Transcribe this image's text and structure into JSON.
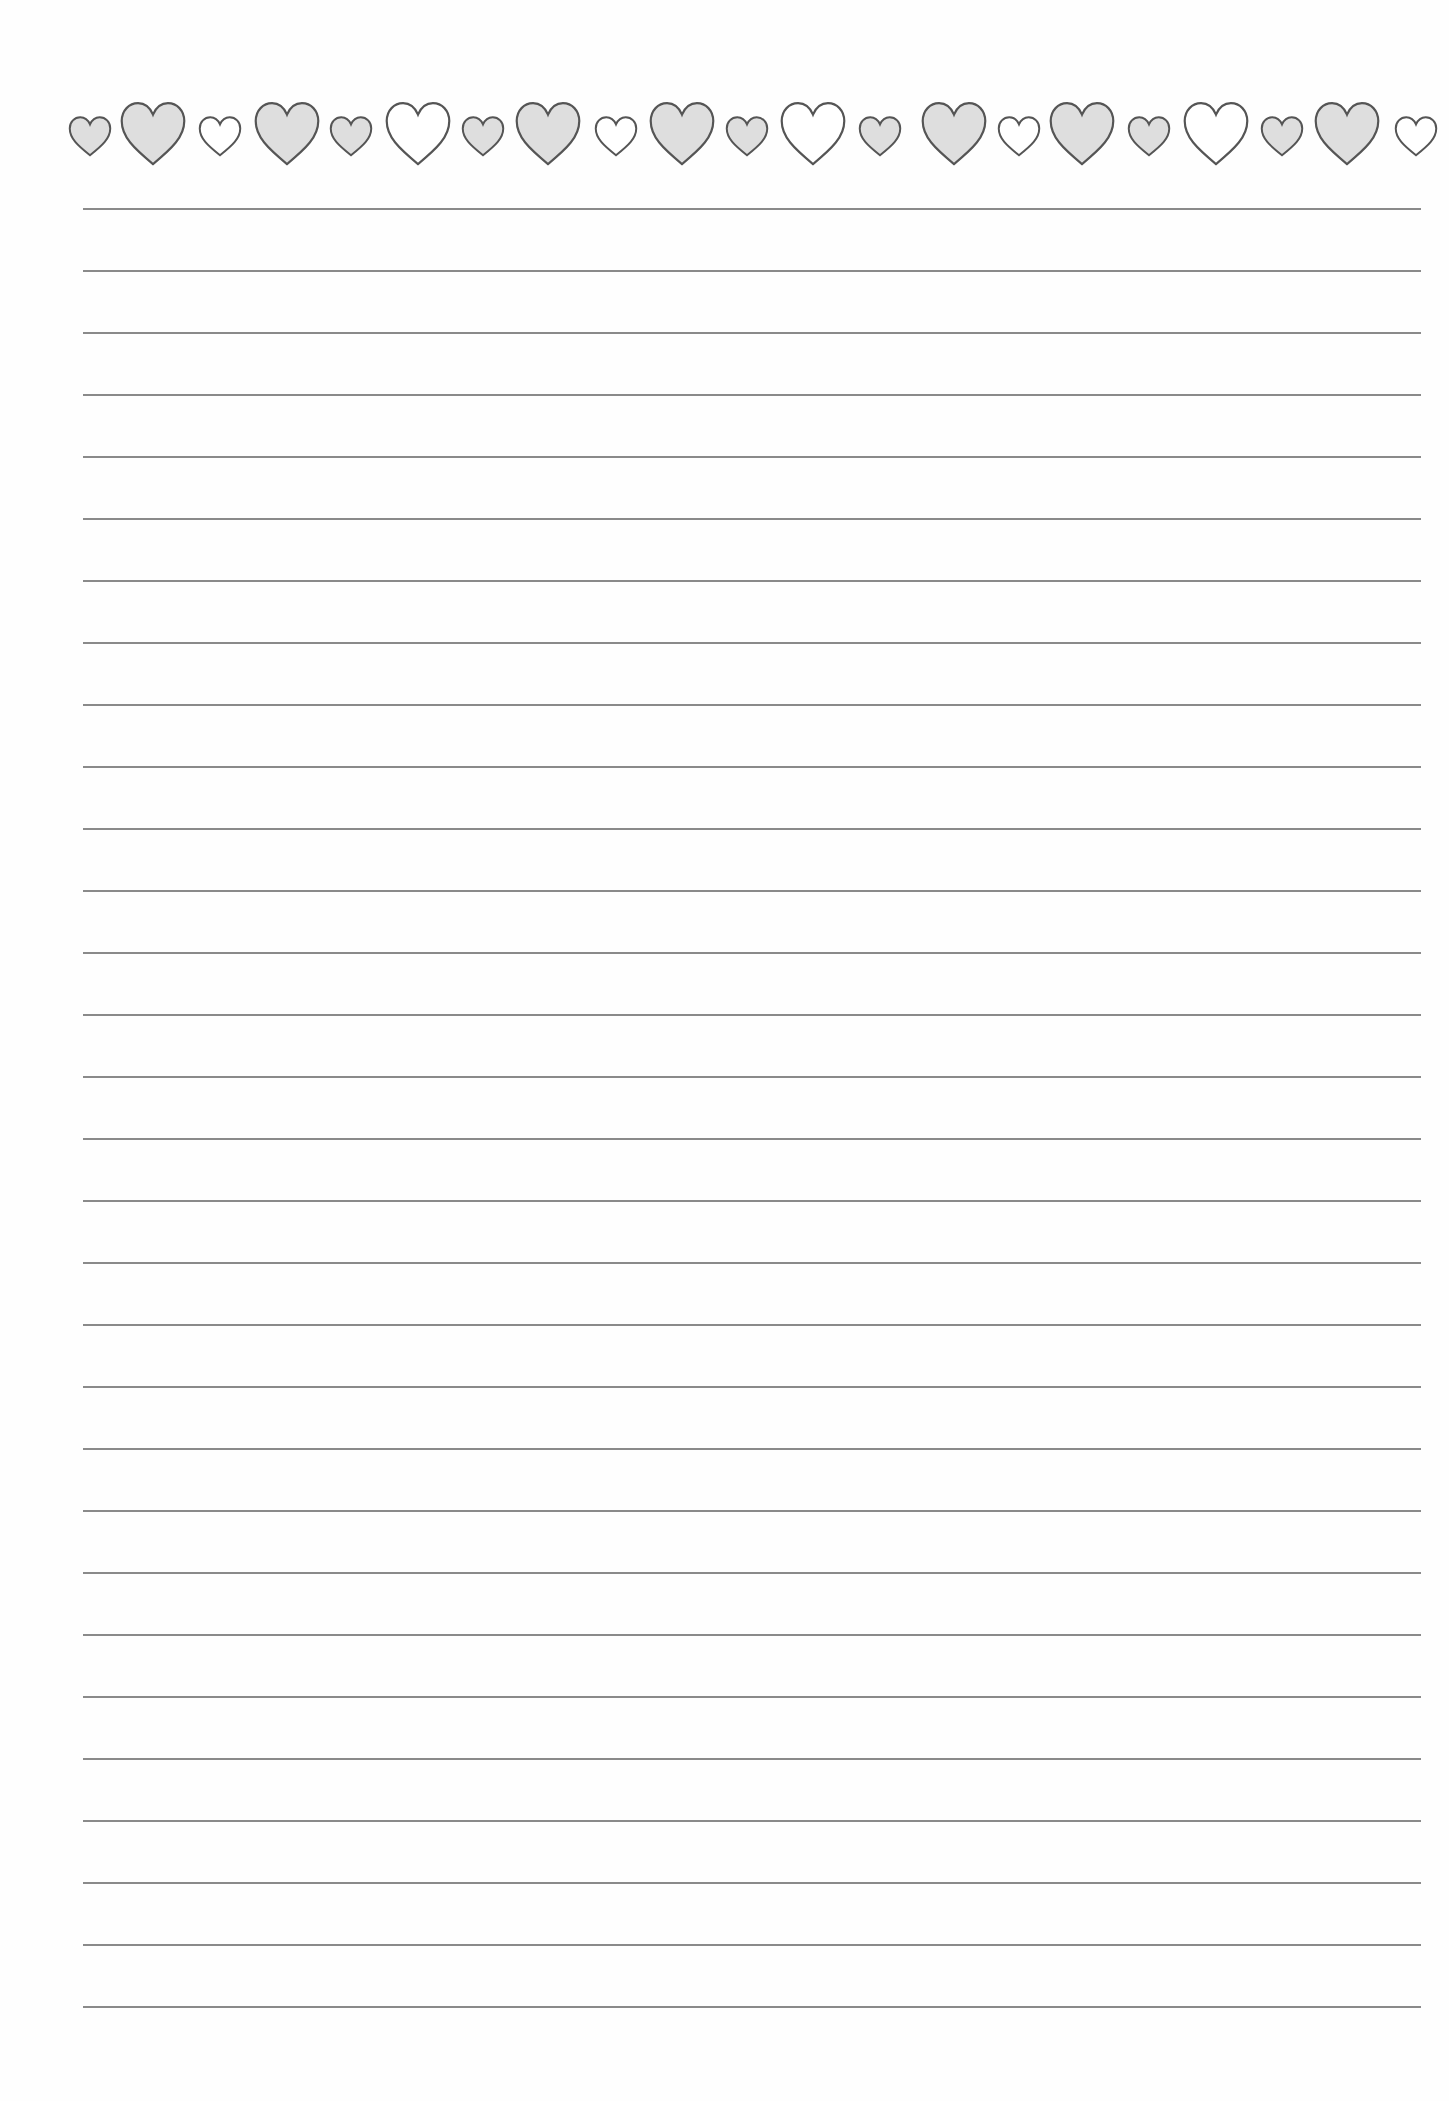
{
  "page": {
    "type": "lined writing paper",
    "background": "#fefefe",
    "line_color": "#8a8a8a",
    "heart_fill": "#dedede",
    "heart_stroke": "#555555"
  },
  "border": {
    "hearts": [
      {
        "size": "small",
        "style": "filled",
        "cx": 90
      },
      {
        "size": "large",
        "style": "filled",
        "cx": 153
      },
      {
        "size": "small",
        "style": "outline",
        "cx": 220
      },
      {
        "size": "large",
        "style": "filled",
        "cx": 287
      },
      {
        "size": "small",
        "style": "filled",
        "cx": 351
      },
      {
        "size": "large",
        "style": "outline",
        "cx": 418
      },
      {
        "size": "small",
        "style": "filled",
        "cx": 483
      },
      {
        "size": "large",
        "style": "filled",
        "cx": 548
      },
      {
        "size": "small",
        "style": "outline",
        "cx": 616
      },
      {
        "size": "large",
        "style": "filled",
        "cx": 682
      },
      {
        "size": "small",
        "style": "filled",
        "cx": 747
      },
      {
        "size": "large",
        "style": "outline",
        "cx": 813
      },
      {
        "size": "small",
        "style": "filled",
        "cx": 880
      },
      {
        "size": "large",
        "style": "filled",
        "cx": 954
      },
      {
        "size": "small",
        "style": "outline",
        "cx": 1019
      },
      {
        "size": "large",
        "style": "filled",
        "cx": 1082
      },
      {
        "size": "small",
        "style": "filled",
        "cx": 1149
      },
      {
        "size": "large",
        "style": "outline",
        "cx": 1216
      },
      {
        "size": "small",
        "style": "filled",
        "cx": 1282
      },
      {
        "size": "large",
        "style": "filled",
        "cx": 1347
      },
      {
        "size": "small",
        "style": "outline",
        "cx": 1416
      }
    ]
  },
  "lines": {
    "count": 30,
    "first_y": 208,
    "spacing": 62
  }
}
